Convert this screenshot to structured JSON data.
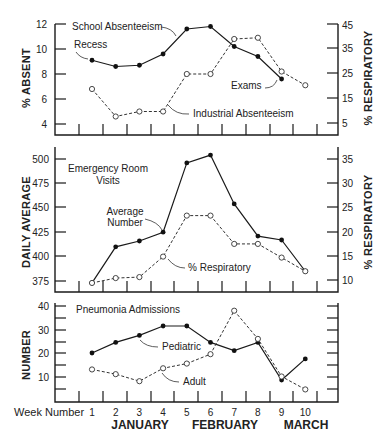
{
  "chart_data": [
    {
      "type": "line",
      "title": "",
      "xlabel": "Week Number",
      "ylabel": "% ABSENT",
      "ylabel_right": "% RESPIRATORY",
      "x": [
        1,
        2,
        3,
        4,
        5,
        6,
        7,
        8,
        9,
        10
      ],
      "ylim": [
        4,
        12
      ],
      "ylim_right": [
        5,
        45
      ],
      "yticks": [
        4,
        6,
        8,
        10,
        12
      ],
      "yticks_right": [
        5,
        15,
        25,
        35,
        45
      ],
      "series": [
        {
          "name": "School Absenteeism",
          "style": "solid-filled",
          "axis": "left",
          "values": [
            9.1,
            8.6,
            8.7,
            9.6,
            11.6,
            11.8,
            10.2,
            9.4,
            7.6,
            null
          ]
        },
        {
          "name": "Industrial Absenteeism",
          "style": "dashed-open",
          "axis": "left",
          "values": [
            6.8,
            4.6,
            5.0,
            5.0,
            8.0,
            8.0,
            10.8,
            10.9,
            8.2,
            7.1
          ]
        }
      ],
      "annotations": [
        "School Absenteeism",
        "Recess",
        "Exams",
        "Industrial Absenteeism"
      ]
    },
    {
      "type": "line",
      "title": "Emergency Room Visits",
      "ylabel": "DAILY AVERAGE",
      "ylabel_right": "% RESPIRATORY",
      "x": [
        1,
        2,
        3,
        4,
        5,
        6,
        7,
        8,
        9,
        10
      ],
      "ylim": [
        375,
        500
      ],
      "ylim_right": [
        10,
        35
      ],
      "yticks": [
        375,
        400,
        425,
        450,
        475,
        500
      ],
      "yticks_right": [
        10,
        15,
        20,
        25,
        30,
        35
      ],
      "series": [
        {
          "name": "Average Number",
          "style": "solid-filled",
          "axis": "left",
          "values": [
            373,
            410,
            416,
            425,
            496,
            504,
            454,
            421,
            417,
            385
          ]
        },
        {
          "name": "% Respiratory",
          "style": "dashed-open",
          "axis": "right",
          "values": [
            9.6,
            10.6,
            10.8,
            15.0,
            23.4,
            23.4,
            17.6,
            17.6,
            14.8,
            12.0
          ]
        }
      ],
      "annotations": [
        "Emergency Room Visits",
        "Average Number",
        "% Respiratory"
      ]
    },
    {
      "type": "line",
      "title": "Pneumonia Admissions",
      "ylabel": "NUMBER",
      "x": [
        1,
        2,
        3,
        4,
        5,
        6,
        7,
        8,
        9,
        10
      ],
      "ylim": [
        0,
        40
      ],
      "yticks": [
        10,
        20,
        30,
        40
      ],
      "series": [
        {
          "name": "Pediatric",
          "style": "solid-filled",
          "values": [
            20,
            24.5,
            27.5,
            31.5,
            31.5,
            24.5,
            21,
            24.5,
            8.5,
            17.5
          ]
        },
        {
          "name": "Adult",
          "style": "dashed-open",
          "values": [
            13,
            11,
            8,
            13.5,
            15.5,
            19.5,
            38,
            26,
            10,
            4.5
          ]
        }
      ],
      "xtick_labels": [
        "1",
        "2",
        "3",
        "4",
        "5",
        "6",
        "7",
        "8",
        "9",
        "10"
      ],
      "months": [
        "JANUARY",
        "FEBRUARY",
        "MARCH"
      ],
      "annotations": [
        "Pneumonia Admissions",
        "Pediatric",
        "Adult"
      ]
    }
  ],
  "labels": {
    "top": {
      "ylabel": "% ABSENT",
      "ylabel_right": "% RESPIRATORY",
      "school": "School Absenteeism",
      "recess": "Recess",
      "exams": "Exams",
      "industrial": "Industrial Absenteeism",
      "yticks": [
        "12",
        "10",
        "8",
        "6",
        "4"
      ],
      "yticks_right": [
        "45",
        "35",
        "25",
        "15",
        "5"
      ]
    },
    "middle": {
      "ylabel": "DAILY AVERAGE",
      "ylabel_right": "% RESPIRATORY",
      "title_line1": "Emergency Room",
      "title_line2": "Visits",
      "avg_line1": "Average",
      "avg_line2": "Number",
      "resp": "% Respiratory",
      "yticks": [
        "500",
        "475",
        "450",
        "425",
        "400",
        "375"
      ],
      "yticks_right": [
        "35",
        "30",
        "25",
        "20",
        "15",
        "10"
      ]
    },
    "bottom": {
      "ylabel": "NUMBER",
      "title": "Pneumonia Admissions",
      "pediatric": "Pediatric",
      "adult": "Adult",
      "yticks": [
        "40",
        "30",
        "20",
        "10"
      ],
      "week_label": "Week Number",
      "weeks": [
        "1",
        "2",
        "3",
        "4",
        "5",
        "6",
        "7",
        "8",
        "9",
        "10"
      ],
      "month_jan": "JANUARY",
      "month_feb": "FEBRUARY",
      "month_mar": "MARCH"
    }
  }
}
